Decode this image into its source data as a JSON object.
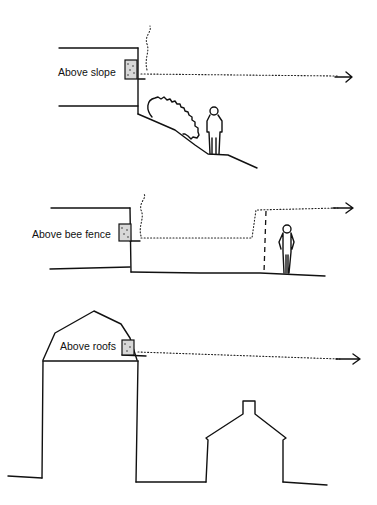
{
  "diagram": {
    "panels": [
      {
        "id": "slope",
        "label": "Above slope"
      },
      {
        "id": "fence",
        "label": "Above bee fence"
      },
      {
        "id": "roofs",
        "label": "Above roofs"
      }
    ],
    "colors": {
      "ink": "#111111",
      "background": "#ffffff"
    }
  }
}
